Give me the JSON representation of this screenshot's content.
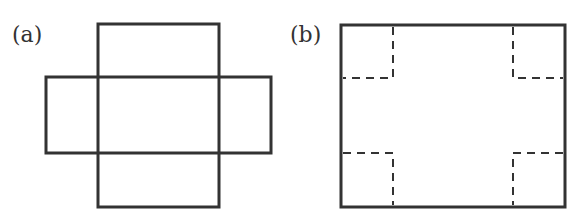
{
  "figures": [
    {
      "label": "(a)",
      "description": "Cross-shaped net of a box (unfolded open box)",
      "stroke_color": "#333333",
      "vertical_rect": {
        "x1": 98,
        "y1": 24,
        "x2": 219,
        "y2": 207
      },
      "horizontal_rect": {
        "x1": 46,
        "y1": 77,
        "x2": 271,
        "y2": 153
      }
    },
    {
      "label": "(b)",
      "description": "Rectangle with dashed square cut-outs at four corners",
      "stroke_color": "#333333",
      "outer_rect": {
        "x1": 341,
        "y1": 25,
        "x2": 565,
        "y2": 207
      },
      "corner_cut_x": [
        393,
        513
      ],
      "corner_cut_y": [
        78,
        153
      ],
      "dash_style": "dashed"
    }
  ]
}
